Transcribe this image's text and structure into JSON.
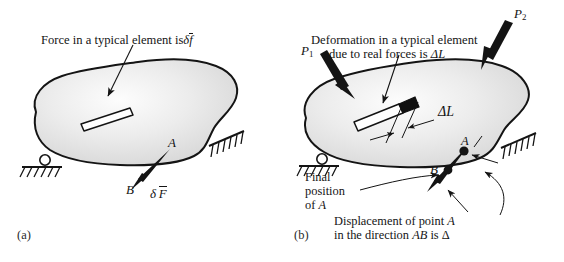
{
  "figure": {
    "background": "#ffffff",
    "body_fill_light": "#fdfdfd",
    "body_fill_mid": "#e3e3e3",
    "body_fill_dark": "#d2d2d2",
    "outline_color": "#141414"
  },
  "panel_a": {
    "label": "(a)",
    "caption": {
      "prefix": "Force in a typical element is",
      "delta": "δ",
      "symbol": "f",
      "overbar": true
    },
    "annotations": {
      "point_a": "A",
      "point_b": "B",
      "force_delta": "δ",
      "force_symbol": "F",
      "force_overbar": true
    },
    "supports": [
      {
        "name": "roller-support",
        "type": "roller"
      },
      {
        "name": "fixed-support",
        "type": "hatched"
      }
    ],
    "element": {
      "name": "typical-element",
      "fill": "#ffffff"
    }
  },
  "panel_b": {
    "label": "(b)",
    "caption": {
      "line1": "Deformation in a typical element",
      "line2_prefix": "due to real forces is",
      "line2_symbol": "ΔL"
    },
    "loads": [
      {
        "name": "load-p1",
        "symbol": "P",
        "subscript": "1"
      },
      {
        "name": "load-p2",
        "symbol": "P",
        "subscript": "2"
      }
    ],
    "annotations": {
      "delta_l": "ΔL",
      "point_a": "A",
      "point_b": "B",
      "final_position": {
        "line1": "Final",
        "line2": "position",
        "line3_prefix": "of",
        "line3_symbol": "A"
      },
      "displacement": {
        "line1_prefix": "Displacement of point",
        "line1_symbol": "A",
        "line2_prefix": "in the direction",
        "line2_symbol": "AB",
        "line2_suffix": "is",
        "line2_value": "Δ"
      }
    },
    "supports": [
      {
        "name": "roller-support",
        "type": "roller"
      },
      {
        "name": "fixed-support",
        "type": "hatched"
      }
    ],
    "element": {
      "name": "deformed-element",
      "fill": "#ffffff",
      "growth_fill": "#111111"
    }
  }
}
